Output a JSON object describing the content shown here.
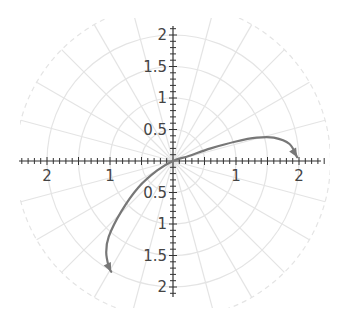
{
  "chart_data": {
    "type": "line",
    "coordinate_system": "polar",
    "title": "",
    "xlabel": "",
    "ylabel": "",
    "xlim": [
      -2.4,
      2.4
    ],
    "ylim": [
      -2.1,
      2.1
    ],
    "grid": true,
    "grid_circles_r": [
      0.5,
      1,
      1.5,
      2,
      2.5
    ],
    "grid_radial_step_deg": 15,
    "x_tick_labels": [
      {
        "value": -2,
        "label": "2"
      },
      {
        "value": -1,
        "label": "1"
      },
      {
        "value": 1,
        "label": "1"
      },
      {
        "value": 2,
        "label": "2"
      }
    ],
    "y_tick_labels": [
      {
        "value": 2,
        "label": "2"
      },
      {
        "value": 1.5,
        "label": "1.5"
      },
      {
        "value": 1,
        "label": "1"
      },
      {
        "value": 0.5,
        "label": "0.5"
      },
      {
        "value": -0.5,
        "label": "0.5"
      },
      {
        "value": -1,
        "label": "1"
      },
      {
        "value": -1.5,
        "label": "1.5"
      },
      {
        "value": -2,
        "label": "2"
      }
    ],
    "minor_tick_step": 0.1,
    "series": [
      {
        "name": "curve",
        "color": "#777777",
        "arrowheads": "both-ends",
        "points": [
          [
            1.97,
            0.06
          ],
          [
            1.85,
            0.27
          ],
          [
            1.6,
            0.37
          ],
          [
            1.33,
            0.37
          ],
          [
            1.0,
            0.31
          ],
          [
            0.6,
            0.2
          ],
          [
            0.25,
            0.08
          ],
          [
            0.0,
            0.0
          ],
          [
            -0.25,
            -0.15
          ],
          [
            -0.55,
            -0.42
          ],
          [
            -0.82,
            -0.8
          ],
          [
            -1.02,
            -1.2
          ],
          [
            -1.06,
            -1.45
          ],
          [
            -1.02,
            -1.68
          ],
          [
            -0.98,
            -1.76
          ]
        ]
      }
    ]
  },
  "colors": {
    "axis": "#333333",
    "grid": "#e4e4e4",
    "curve": "#777777",
    "label": "#444444"
  }
}
